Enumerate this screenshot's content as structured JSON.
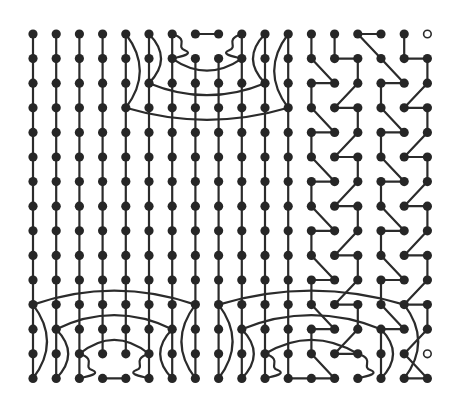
{
  "diagram": {
    "title": "",
    "type": "grid-graph",
    "grid": {
      "cols": 18,
      "rows": 15,
      "x0": 33,
      "dx": 23.2,
      "y0": 34,
      "dy": 24.6
    },
    "colors": {
      "edge": "#2b2b2b",
      "node": "#262626",
      "background": "#ffffff"
    },
    "empty_nodes": [
      [
        17,
        0
      ],
      [
        17,
        13
      ]
    ],
    "vertical_columns": [
      {
        "col": 0,
        "from": 0,
        "to": 14
      },
      {
        "col": 1,
        "from": 0,
        "to": 14
      },
      {
        "col": 2,
        "from": 0,
        "to": 14
      },
      {
        "col": 3,
        "from": 0,
        "to": 13
      },
      {
        "col": 4,
        "from": 0,
        "to": 13
      },
      {
        "col": 5,
        "from": 0,
        "to": 14
      },
      {
        "col": 6,
        "from": 0,
        "to": 14
      },
      {
        "col": 7,
        "from": 1,
        "to": 14
      },
      {
        "col": 8,
        "from": 1,
        "to": 14
      },
      {
        "col": 9,
        "from": 0,
        "to": 14
      },
      {
        "col": 10,
        "from": 0,
        "to": 14
      },
      {
        "col": 11,
        "from": 0,
        "to": 14
      }
    ],
    "straight_edges": [
      [
        [
          7,
          0
        ],
        [
          8,
          0
        ]
      ],
      [
        [
          3,
          14
        ],
        [
          4,
          14
        ]
      ],
      [
        [
          12,
          0
        ],
        [
          12,
          1
        ]
      ],
      [
        [
          13,
          0
        ],
        [
          13,
          1
        ]
      ],
      [
        [
          13,
          1
        ],
        [
          14,
          1
        ]
      ],
      [
        [
          14,
          0
        ],
        [
          15,
          0
        ]
      ],
      [
        [
          14,
          0
        ],
        [
          15,
          1
        ]
      ],
      [
        [
          15,
          1
        ],
        [
          16,
          2
        ]
      ],
      [
        [
          16,
          0
        ],
        [
          16,
          1
        ]
      ],
      [
        [
          16,
          1
        ],
        [
          17,
          1
        ]
      ],
      [
        [
          17,
          1
        ],
        [
          17,
          2
        ]
      ],
      [
        [
          12,
          1
        ],
        [
          13,
          2
        ]
      ],
      [
        [
          12,
          2
        ],
        [
          13,
          2
        ]
      ],
      [
        [
          12,
          2
        ],
        [
          12,
          3
        ]
      ],
      [
        [
          12,
          3
        ],
        [
          13,
          4
        ]
      ],
      [
        [
          12,
          4
        ],
        [
          13,
          4
        ]
      ],
      [
        [
          12,
          4
        ],
        [
          12,
          5
        ]
      ],
      [
        [
          12,
          5
        ],
        [
          13,
          6
        ]
      ],
      [
        [
          12,
          6
        ],
        [
          13,
          6
        ]
      ],
      [
        [
          12,
          6
        ],
        [
          12,
          7
        ]
      ],
      [
        [
          12,
          7
        ],
        [
          13,
          8
        ]
      ],
      [
        [
          12,
          8
        ],
        [
          13,
          8
        ]
      ],
      [
        [
          12,
          8
        ],
        [
          12,
          9
        ]
      ],
      [
        [
          12,
          9
        ],
        [
          13,
          10
        ]
      ],
      [
        [
          12,
          10
        ],
        [
          13,
          10
        ]
      ],
      [
        [
          12,
          10
        ],
        [
          12,
          11
        ]
      ],
      [
        [
          12,
          11
        ],
        [
          13,
          12
        ]
      ],
      [
        [
          12,
          12
        ],
        [
          13,
          12
        ]
      ],
      [
        [
          12,
          12
        ],
        [
          12,
          13
        ]
      ],
      [
        [
          12,
          13
        ],
        [
          13,
          14
        ]
      ],
      [
        [
          12,
          14
        ],
        [
          13,
          14
        ]
      ],
      [
        [
          11,
          14
        ],
        [
          12,
          14
        ]
      ],
      [
        [
          14,
          1
        ],
        [
          14,
          2
        ]
      ],
      [
        [
          14,
          2
        ],
        [
          13,
          3
        ]
      ],
      [
        [
          13,
          3
        ],
        [
          14,
          3
        ]
      ],
      [
        [
          14,
          3
        ],
        [
          14,
          4
        ]
      ],
      [
        [
          14,
          4
        ],
        [
          13,
          5
        ]
      ],
      [
        [
          13,
          5
        ],
        [
          14,
          5
        ]
      ],
      [
        [
          14,
          5
        ],
        [
          14,
          6
        ]
      ],
      [
        [
          14,
          6
        ],
        [
          13,
          7
        ]
      ],
      [
        [
          13,
          7
        ],
        [
          14,
          7
        ]
      ],
      [
        [
          14,
          7
        ],
        [
          14,
          8
        ]
      ],
      [
        [
          14,
          8
        ],
        [
          13,
          9
        ]
      ],
      [
        [
          13,
          9
        ],
        [
          14,
          9
        ]
      ],
      [
        [
          14,
          9
        ],
        [
          14,
          10
        ]
      ],
      [
        [
          14,
          10
        ],
        [
          13,
          11
        ]
      ],
      [
        [
          13,
          11
        ],
        [
          14,
          11
        ]
      ],
      [
        [
          14,
          11
        ],
        [
          14,
          12
        ]
      ],
      [
        [
          14,
          12
        ],
        [
          13,
          13
        ]
      ],
      [
        [
          13,
          13
        ],
        [
          14,
          13
        ]
      ],
      [
        [
          15,
          2
        ],
        [
          16,
          2
        ]
      ],
      [
        [
          15,
          2
        ],
        [
          15,
          3
        ]
      ],
      [
        [
          15,
          3
        ],
        [
          16,
          4
        ]
      ],
      [
        [
          15,
          4
        ],
        [
          16,
          4
        ]
      ],
      [
        [
          15,
          4
        ],
        [
          15,
          5
        ]
      ],
      [
        [
          15,
          5
        ],
        [
          16,
          6
        ]
      ],
      [
        [
          15,
          6
        ],
        [
          16,
          6
        ]
      ],
      [
        [
          15,
          6
        ],
        [
          15,
          7
        ]
      ],
      [
        [
          15,
          7
        ],
        [
          16,
          8
        ]
      ],
      [
        [
          15,
          8
        ],
        [
          16,
          8
        ]
      ],
      [
        [
          15,
          8
        ],
        [
          15,
          9
        ]
      ],
      [
        [
          15,
          9
        ],
        [
          16,
          10
        ]
      ],
      [
        [
          15,
          10
        ],
        [
          16,
          10
        ]
      ],
      [
        [
          15,
          10
        ],
        [
          15,
          11
        ]
      ],
      [
        [
          15,
          11
        ],
        [
          16,
          12
        ]
      ],
      [
        [
          15,
          12
        ],
        [
          16,
          12
        ]
      ],
      [
        [
          15,
          12
        ],
        [
          15,
          13
        ]
      ],
      [
        [
          15,
          13
        ],
        [
          15,
          14
        ]
      ],
      [
        [
          17,
          2
        ],
        [
          16,
          3
        ]
      ],
      [
        [
          16,
          3
        ],
        [
          17,
          3
        ]
      ],
      [
        [
          17,
          3
        ],
        [
          17,
          4
        ]
      ],
      [
        [
          17,
          4
        ],
        [
          16,
          5
        ]
      ],
      [
        [
          16,
          5
        ],
        [
          17,
          5
        ]
      ],
      [
        [
          17,
          5
        ],
        [
          17,
          6
        ]
      ],
      [
        [
          17,
          6
        ],
        [
          16,
          7
        ]
      ],
      [
        [
          16,
          7
        ],
        [
          17,
          7
        ]
      ],
      [
        [
          17,
          7
        ],
        [
          17,
          8
        ]
      ],
      [
        [
          17,
          8
        ],
        [
          16,
          9
        ]
      ],
      [
        [
          16,
          9
        ],
        [
          17,
          9
        ]
      ],
      [
        [
          17,
          9
        ],
        [
          17,
          10
        ]
      ],
      [
        [
          17,
          10
        ],
        [
          16,
          11
        ]
      ],
      [
        [
          16,
          11
        ],
        [
          17,
          11
        ]
      ],
      [
        [
          17,
          11
        ],
        [
          17,
          12
        ]
      ],
      [
        [
          17,
          12
        ],
        [
          16,
          13
        ]
      ],
      [
        [
          16,
          13
        ],
        [
          17,
          14
        ]
      ],
      [
        [
          16,
          14
        ],
        [
          17,
          14
        ]
      ]
    ],
    "arcs": [
      {
        "from": [
          6,
          1
        ],
        "to": [
          9,
          1
        ],
        "bend": 12
      },
      {
        "from": [
          5,
          2
        ],
        "to": [
          10,
          2
        ],
        "bend": 12
      },
      {
        "from": [
          4,
          3
        ],
        "to": [
          11,
          3
        ],
        "bend": 12
      },
      {
        "from": [
          0,
          11
        ],
        "to": [
          7,
          11
        ],
        "bend": -14
      },
      {
        "from": [
          1,
          12
        ],
        "to": [
          6,
          12
        ],
        "bend": -14
      },
      {
        "from": [
          2,
          13
        ],
        "to": [
          5,
          13
        ],
        "bend": -14
      },
      {
        "from": [
          8,
          11
        ],
        "to": [
          16,
          11
        ],
        "bend": -14
      },
      {
        "from": [
          9,
          12
        ],
        "to": [
          15,
          12
        ],
        "bend": -14
      },
      {
        "from": [
          10,
          13
        ],
        "to": [
          14,
          13
        ],
        "bend": -14
      }
    ],
    "side_curves": [
      {
        "col": 4,
        "from": 0,
        "to": 3,
        "bulge": 14
      },
      {
        "col": 5,
        "from": 0,
        "to": 2,
        "bulge": 12
      },
      {
        "col": 6,
        "from": 0,
        "to": 1,
        "bulge": 14,
        "loop": true
      },
      {
        "col": 9,
        "from": 0,
        "to": 1,
        "bulge": -14,
        "loop": true
      },
      {
        "col": 10,
        "from": 0,
        "to": 2,
        "bulge": -12
      },
      {
        "col": 11,
        "from": 0,
        "to": 3,
        "bulge": -14
      },
      {
        "col": 0,
        "from": 11,
        "to": 14,
        "bulge": 14
      },
      {
        "col": 1,
        "from": 12,
        "to": 14,
        "bulge": 12
      },
      {
        "col": 2,
        "from": 13,
        "to": 14,
        "bulge": 14,
        "loop": true
      },
      {
        "col": 5,
        "from": 13,
        "to": 14,
        "bulge": -14,
        "loop": true
      },
      {
        "col": 6,
        "from": 12,
        "to": 14,
        "bulge": -12
      },
      {
        "col": 7,
        "from": 11,
        "to": 14,
        "bulge": -14
      },
      {
        "col": 8,
        "from": 11,
        "to": 14,
        "bulge": 14
      },
      {
        "col": 9,
        "from": 12,
        "to": 14,
        "bulge": 12
      },
      {
        "col": 10,
        "from": 13,
        "to": 14,
        "bulge": 14,
        "loop": true
      },
      {
        "col": 14,
        "from": 13,
        "to": 14,
        "bulge": 14,
        "loop": true
      },
      {
        "col": 15,
        "from": 12,
        "to": 14,
        "bulge": 12
      },
      {
        "col": 16,
        "from": 11,
        "to": 14,
        "bulge": 14
      }
    ]
  }
}
